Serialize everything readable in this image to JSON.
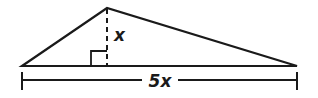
{
  "figure": {
    "kind": "geometry-diagram",
    "background_color": "#ffffff",
    "stroke_color": "#1a1a1a",
    "labels": {
      "altitude": "x",
      "base": "5x"
    },
    "markers": {
      "right_angle": "right-angle-square",
      "altitude_style": "dashed",
      "dimension_end_caps": "tick"
    },
    "geometry": {
      "triangle": {
        "left_vertex": [
          22,
          66
        ],
        "apex": [
          107,
          8
        ],
        "right_vertex": [
          297,
          66
        ]
      },
      "altitude": {
        "x": 107,
        "y_top": 8,
        "y_bottom": 66
      },
      "right_angle_square": {
        "x": 91,
        "y": 50,
        "size": 16
      },
      "dimension_line": {
        "y": 80,
        "x_start": 22,
        "x_end": 297,
        "gap_start": 142,
        "gap_end": 178,
        "cap_top": 72,
        "cap_bottom": 90
      },
      "label_positions": {
        "altitude": [
          114,
          41
        ],
        "base": [
          160,
          87
        ]
      }
    }
  }
}
